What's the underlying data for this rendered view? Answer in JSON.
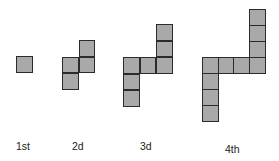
{
  "colors": {
    "fill": "#a9a9a9",
    "border": "#2b2b2b",
    "text": "#222222"
  },
  "cell_size": 16.5,
  "figures": [
    {
      "label": "1st",
      "label_pos": [
        16,
        141
      ],
      "squares": [
        [
          16,
          56
        ]
      ]
    },
    {
      "label": "2d",
      "label_pos": [
        72,
        141
      ],
      "squares": [
        [
          78.5,
          40
        ],
        [
          62,
          56.5
        ],
        [
          78.5,
          56.5
        ],
        [
          62,
          73
        ]
      ]
    },
    {
      "label": "3d",
      "label_pos": [
        140,
        141
      ],
      "squares": [
        [
          156,
          24
        ],
        [
          156,
          40.5
        ],
        [
          123,
          57
        ],
        [
          139.5,
          57
        ],
        [
          156,
          57
        ],
        [
          123,
          73.5
        ],
        [
          123,
          90
        ]
      ]
    },
    {
      "label": "4th",
      "label_pos": [
        225,
        144
      ],
      "squares": [
        [
          249,
          9
        ],
        [
          249,
          25
        ],
        [
          249,
          41
        ],
        [
          202,
          57
        ],
        [
          217.7,
          57
        ],
        [
          233.4,
          57
        ],
        [
          249,
          57
        ],
        [
          202,
          73
        ],
        [
          202,
          89
        ],
        [
          202,
          105
        ]
      ]
    }
  ]
}
